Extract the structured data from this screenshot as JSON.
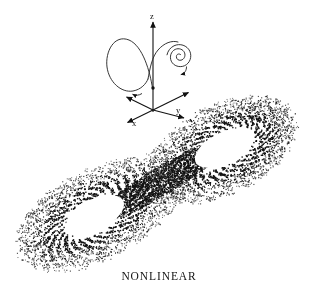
{
  "figure": {
    "caption": "NONLINEAR",
    "background_color": "#ffffff",
    "ink_color": "#111111",
    "width": 318,
    "height": 305
  },
  "axes_inset": {
    "origin": {
      "x": 153,
      "y": 110
    },
    "axis_labels": {
      "x": "x",
      "y": "y",
      "z": "z"
    },
    "label_positions": {
      "z": {
        "x": 150,
        "y": 13
      },
      "y": {
        "x": 176,
        "y": 108
      },
      "x": {
        "x": 133,
        "y": 120
      }
    },
    "axis_endpoints": {
      "z_tip": {
        "x": 153,
        "y": 20
      },
      "y_tip": {
        "x": 189,
        "y": 92
      },
      "x_tip": {
        "x": 127,
        "y": 124
      },
      "negative_y_tip": {
        "x": 127,
        "y": 97
      },
      "negative_x_tip": {
        "x": 184,
        "y": 117
      }
    },
    "trajectory": {
      "description": "chaotic-orbit-curve",
      "big_loop_center": {
        "x": 131,
        "y": 58
      },
      "spiral_center": {
        "x": 180,
        "y": 55
      },
      "arrowheads": 2
    }
  },
  "chart_data": {
    "type": "scatter",
    "title": "NONLINEAR",
    "xlabel": "",
    "ylabel": "",
    "legend": [],
    "grid": false,
    "lobes": [
      {
        "name": "left-lobe",
        "center": {
          "x": 95,
          "y": 215
        },
        "hole_rx": 33,
        "hole_ry": 16,
        "outer_rx": 86,
        "outer_ry": 44,
        "rotation_deg": -27
      },
      {
        "name": "right-lobe",
        "center": {
          "x": 224,
          "y": 148
        },
        "hole_rx": 33,
        "hole_ry": 16,
        "outer_rx": 86,
        "outer_ry": 44,
        "rotation_deg": -27
      }
    ],
    "point_count": 9000,
    "point_color": "#111111",
    "xlim": [
      12,
      302
    ],
    "ylim": [
      72,
      290
    ]
  }
}
